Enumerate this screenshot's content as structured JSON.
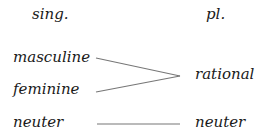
{
  "headers": {
    "singular": "sing.",
    "plural": "pl."
  },
  "singular": [
    "masculine",
    "feminine",
    "neuter"
  ],
  "plural": [
    "rational",
    "neuter"
  ],
  "mappings": [
    {
      "from": "masculine",
      "to": "rational"
    },
    {
      "from": "feminine",
      "to": "rational"
    },
    {
      "from": "neuter",
      "to": "neuter"
    }
  ],
  "colors": {
    "text": "#1a1a1a",
    "line": "#777777"
  }
}
